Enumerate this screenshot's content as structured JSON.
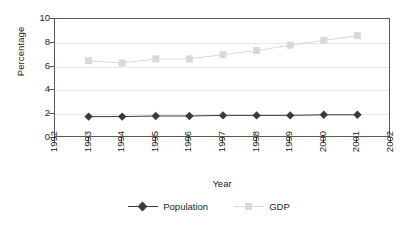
{
  "chart_data": {
    "type": "line",
    "title": "",
    "xlabel": "Year",
    "ylabel": "Percentage",
    "x": [
      1993,
      1994,
      1995,
      1996,
      1997,
      1998,
      1999,
      2000,
      2001
    ],
    "xlim": [
      1992,
      2002
    ],
    "ylim": [
      0,
      10
    ],
    "ytick_labels": [
      "10",
      "8",
      "6",
      "4",
      "2",
      "0"
    ],
    "yticks": [
      10,
      8,
      6,
      4,
      2,
      0
    ],
    "xtick_labels": [
      "1992",
      "1993",
      "1994",
      "1995",
      "1996",
      "1997",
      "1998",
      "1999",
      "2000",
      "2001",
      "2002"
    ],
    "xticks": [
      1992,
      1993,
      1994,
      1995,
      1996,
      1997,
      1998,
      1999,
      2000,
      2001,
      2002
    ],
    "grid": true,
    "legend_position": "bottom-center",
    "series": [
      {
        "name": "Population",
        "values": [
          1.8,
          1.8,
          1.85,
          1.85,
          1.9,
          1.9,
          1.9,
          1.95,
          1.95
        ],
        "color": "#3b3b3b",
        "marker": "diamond"
      },
      {
        "name": "GDP",
        "values": [
          6.5,
          6.3,
          6.65,
          6.65,
          7.0,
          7.35,
          7.8,
          8.2,
          8.6
        ],
        "color": "#d9d9d9",
        "marker": "square"
      }
    ]
  },
  "axes": {
    "y_title": "Percentage",
    "x_title": "Year"
  },
  "legend": {
    "entries": [
      {
        "label": "Population"
      },
      {
        "label": "GDP"
      }
    ]
  },
  "colors": {
    "frame": "#58595b",
    "grid": "#e8e8e8",
    "population": "#3b3b3b",
    "gdp": "#d9d9d9",
    "text": "#231f20",
    "background": "#ffffff"
  }
}
